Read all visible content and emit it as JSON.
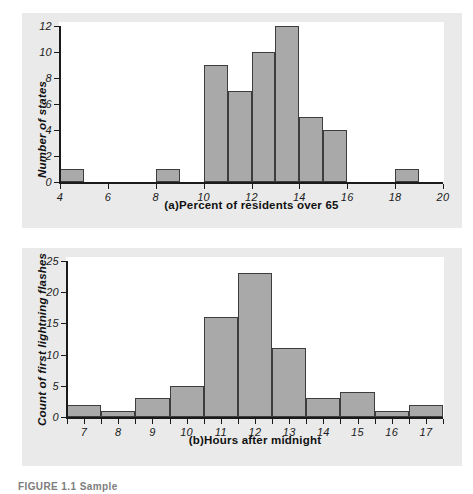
{
  "figure": {
    "caption": "FIGURE 1.1 Sample"
  },
  "colors": {
    "bar_fill": "#a9a9a9",
    "bar_stroke": "#3d3d3d",
    "panel_background": "#eaeaea",
    "plot_background": "#ffffff",
    "axis": "#1a1a1a"
  },
  "chart_data": [
    {
      "type": "bar",
      "id": "a",
      "title": "",
      "xlabel": "(a)Percent of residents over 65",
      "ylabel": "Number of states",
      "xlim": [
        4,
        20
      ],
      "ylim": [
        0,
        12
      ],
      "xticks": [
        "4",
        "6",
        "8",
        "10",
        "12",
        "14",
        "16",
        "18",
        "20"
      ],
      "xtick_values": [
        4,
        6,
        8,
        10,
        12,
        14,
        16,
        18,
        20
      ],
      "yticks": [
        "0",
        "2",
        "4",
        "6",
        "8",
        "10",
        "12"
      ],
      "ytick_values": [
        0,
        2,
        4,
        6,
        8,
        10,
        12
      ],
      "grid": false,
      "legend": "none",
      "bin_width": 1,
      "bins": [
        {
          "left": 4,
          "right": 5,
          "value": 1
        },
        {
          "left": 5,
          "right": 6,
          "value": 0
        },
        {
          "left": 6,
          "right": 7,
          "value": 0
        },
        {
          "left": 7,
          "right": 8,
          "value": 0
        },
        {
          "left": 8,
          "right": 9,
          "value": 1
        },
        {
          "left": 9,
          "right": 10,
          "value": 0
        },
        {
          "left": 10,
          "right": 11,
          "value": 9
        },
        {
          "left": 11,
          "right": 12,
          "value": 7
        },
        {
          "left": 12,
          "right": 13,
          "value": 10
        },
        {
          "left": 13,
          "right": 14,
          "value": 12
        },
        {
          "left": 14,
          "right": 15,
          "value": 5
        },
        {
          "left": 15,
          "right": 16,
          "value": 4
        },
        {
          "left": 16,
          "right": 17,
          "value": 0
        },
        {
          "left": 17,
          "right": 18,
          "value": 0
        },
        {
          "left": 18,
          "right": 19,
          "value": 1
        },
        {
          "left": 19,
          "right": 20,
          "value": 0
        }
      ],
      "categories": [
        "4-5",
        "5-6",
        "6-7",
        "7-8",
        "8-9",
        "9-10",
        "10-11",
        "11-12",
        "12-13",
        "13-14",
        "14-15",
        "15-16",
        "16-17",
        "17-18",
        "18-19",
        "19-20"
      ],
      "values": [
        1,
        0,
        0,
        0,
        1,
        0,
        9,
        7,
        10,
        12,
        5,
        4,
        0,
        0,
        1,
        0
      ]
    },
    {
      "type": "bar",
      "id": "b",
      "title": "",
      "xlabel": "(b)Hours after midnight",
      "ylabel": "Count of first lightning flashes",
      "xlim": [
        6.5,
        17.5
      ],
      "ylim": [
        0,
        25
      ],
      "xticks": [
        "7",
        "8",
        "9",
        "10",
        "11",
        "12",
        "13",
        "14",
        "15",
        "16",
        "17"
      ],
      "xtick_values": [
        7,
        8,
        9,
        10,
        11,
        12,
        13,
        14,
        15,
        16,
        17
      ],
      "yticks": [
        "0",
        "5",
        "10",
        "15",
        "20",
        "25"
      ],
      "ytick_values": [
        0,
        5,
        10,
        15,
        20,
        25
      ],
      "grid": false,
      "legend": "none",
      "bin_width": 1,
      "bins": [
        {
          "left": 6.5,
          "right": 7.5,
          "center": 7,
          "value": 2
        },
        {
          "left": 7.5,
          "right": 8.5,
          "center": 8,
          "value": 1
        },
        {
          "left": 8.5,
          "right": 9.5,
          "center": 9,
          "value": 3
        },
        {
          "left": 9.5,
          "right": 10.5,
          "center": 10,
          "value": 5
        },
        {
          "left": 10.5,
          "right": 11.5,
          "center": 11,
          "value": 16
        },
        {
          "left": 11.5,
          "right": 12.5,
          "center": 12,
          "value": 23
        },
        {
          "left": 12.5,
          "right": 13.5,
          "center": 13,
          "value": 11
        },
        {
          "left": 13.5,
          "right": 14.5,
          "center": 14,
          "value": 3
        },
        {
          "left": 14.5,
          "right": 15.5,
          "center": 15,
          "value": 4
        },
        {
          "left": 15.5,
          "right": 16.5,
          "center": 16,
          "value": 1
        },
        {
          "left": 16.5,
          "right": 17.5,
          "center": 17,
          "value": 2
        }
      ],
      "categories": [
        "7",
        "8",
        "9",
        "10",
        "11",
        "12",
        "13",
        "14",
        "15",
        "16",
        "17"
      ],
      "values": [
        2,
        1,
        3,
        5,
        16,
        23,
        11,
        3,
        4,
        1,
        2
      ]
    }
  ]
}
